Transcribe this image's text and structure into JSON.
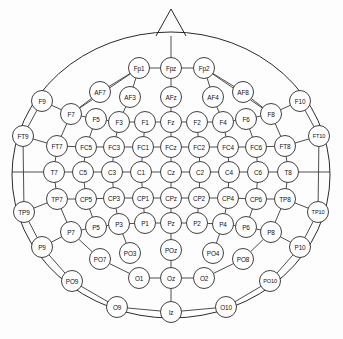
{
  "diagram": {
    "view": "top-down head map, nose at top",
    "colors": {
      "background": "#fdfdfd",
      "outline": "#2b2b2b",
      "link": "#3a3a3a",
      "node_fill": "#ffffff",
      "label": "#111111"
    },
    "head": {
      "center_x": 171,
      "center_y": 175,
      "radius_x": 159,
      "radius_y": 143
    },
    "nose": {
      "apex_x": 171,
      "apex_y": 9,
      "left_x": 156,
      "right_x": 186,
      "base_y": 36
    }
  },
  "electrodes": [
    {
      "label": "Fp1",
      "x": 139,
      "y": 68,
      "row": "Fp"
    },
    {
      "label": "Fpz",
      "x": 171,
      "y": 68,
      "row": "Fp"
    },
    {
      "label": "Fp2",
      "x": 204,
      "y": 68,
      "row": "Fp"
    },
    {
      "label": "AF7",
      "x": 100,
      "y": 92,
      "row": "AF"
    },
    {
      "label": "AF3",
      "x": 130,
      "y": 97,
      "row": "AF"
    },
    {
      "label": "AFz",
      "x": 171,
      "y": 97,
      "row": "AF"
    },
    {
      "label": "AF4",
      "x": 213,
      "y": 97,
      "row": "AF"
    },
    {
      "label": "AF8",
      "x": 243,
      "y": 92,
      "row": "AF"
    },
    {
      "label": "F9",
      "x": 42,
      "y": 101,
      "row": "F-outer"
    },
    {
      "label": "F10",
      "x": 300,
      "y": 101,
      "row": "F-outer"
    },
    {
      "label": "F7",
      "x": 71,
      "y": 114,
      "row": "F"
    },
    {
      "label": "F5",
      "x": 96,
      "y": 119,
      "row": "F"
    },
    {
      "label": "F3",
      "x": 119,
      "y": 122,
      "row": "F"
    },
    {
      "label": "F1",
      "x": 145,
      "y": 122,
      "row": "F"
    },
    {
      "label": "Fz",
      "x": 171,
      "y": 122,
      "row": "F"
    },
    {
      "label": "F2",
      "x": 197,
      "y": 122,
      "row": "F"
    },
    {
      "label": "F4",
      "x": 223,
      "y": 122,
      "row": "F"
    },
    {
      "label": "F6",
      "x": 246,
      "y": 119,
      "row": "F"
    },
    {
      "label": "F8",
      "x": 271,
      "y": 114,
      "row": "F"
    },
    {
      "label": "FT9",
      "x": 23,
      "y": 136,
      "row": "FT-outer"
    },
    {
      "label": "FT10",
      "x": 319,
      "y": 136,
      "row": "FT-outer"
    },
    {
      "label": "FT7",
      "x": 57,
      "y": 146,
      "row": "FC"
    },
    {
      "label": "FC5",
      "x": 86,
      "y": 147,
      "row": "FC"
    },
    {
      "label": "FC3",
      "x": 114,
      "y": 147,
      "row": "FC"
    },
    {
      "label": "FC1",
      "x": 143,
      "y": 147,
      "row": "FC"
    },
    {
      "label": "FCz",
      "x": 171,
      "y": 147,
      "row": "FC"
    },
    {
      "label": "FC2",
      "x": 199,
      "y": 147,
      "row": "FC"
    },
    {
      "label": "FC4",
      "x": 228,
      "y": 147,
      "row": "FC"
    },
    {
      "label": "FC6",
      "x": 256,
      "y": 147,
      "row": "FC"
    },
    {
      "label": "FT8",
      "x": 285,
      "y": 146,
      "row": "FC"
    },
    {
      "label": "T7",
      "x": 54,
      "y": 172,
      "row": "C"
    },
    {
      "label": "C5",
      "x": 83,
      "y": 172,
      "row": "C"
    },
    {
      "label": "C3",
      "x": 112,
      "y": 172,
      "row": "C"
    },
    {
      "label": "C1",
      "x": 141,
      "y": 172,
      "row": "C"
    },
    {
      "label": "Cz",
      "x": 171,
      "y": 172,
      "row": "C"
    },
    {
      "label": "C2",
      "x": 200,
      "y": 172,
      "row": "C"
    },
    {
      "label": "C4",
      "x": 229,
      "y": 172,
      "row": "C"
    },
    {
      "label": "C6",
      "x": 258,
      "y": 172,
      "row": "C"
    },
    {
      "label": "T8",
      "x": 288,
      "y": 172,
      "row": "C"
    },
    {
      "label": "TP9",
      "x": 24,
      "y": 212,
      "row": "TP-outer"
    },
    {
      "label": "TP10",
      "x": 318,
      "y": 212,
      "row": "TP-outer"
    },
    {
      "label": "TP7",
      "x": 57,
      "y": 199,
      "row": "CP"
    },
    {
      "label": "CP5",
      "x": 86,
      "y": 199,
      "row": "CP"
    },
    {
      "label": "CP3",
      "x": 114,
      "y": 198,
      "row": "CP"
    },
    {
      "label": "CP1",
      "x": 143,
      "y": 198,
      "row": "CP"
    },
    {
      "label": "CPz",
      "x": 171,
      "y": 198,
      "row": "CP"
    },
    {
      "label": "CP2",
      "x": 199,
      "y": 198,
      "row": "CP"
    },
    {
      "label": "CP4",
      "x": 228,
      "y": 198,
      "row": "CP"
    },
    {
      "label": "CP6",
      "x": 256,
      "y": 199,
      "row": "CP"
    },
    {
      "label": "TP8",
      "x": 285,
      "y": 199,
      "row": "CP"
    },
    {
      "label": "P9",
      "x": 42,
      "y": 247,
      "row": "P-outer"
    },
    {
      "label": "P10",
      "x": 300,
      "y": 247,
      "row": "P-outer"
    },
    {
      "label": "P7",
      "x": 71,
      "y": 232,
      "row": "P"
    },
    {
      "label": "P5",
      "x": 96,
      "y": 227,
      "row": "P"
    },
    {
      "label": "P3",
      "x": 119,
      "y": 224,
      "row": "P"
    },
    {
      "label": "P1",
      "x": 145,
      "y": 223,
      "row": "P"
    },
    {
      "label": "Pz",
      "x": 171,
      "y": 223,
      "row": "P"
    },
    {
      "label": "P2",
      "x": 197,
      "y": 223,
      "row": "P"
    },
    {
      "label": "P4",
      "x": 223,
      "y": 224,
      "row": "P"
    },
    {
      "label": "P6",
      "x": 246,
      "y": 227,
      "row": "P"
    },
    {
      "label": "P8",
      "x": 271,
      "y": 232,
      "row": "P"
    },
    {
      "label": "PO9",
      "x": 72,
      "y": 281,
      "row": "PO-outer"
    },
    {
      "label": "PO10",
      "x": 270,
      "y": 281,
      "row": "PO-outer"
    },
    {
      "label": "PO7",
      "x": 100,
      "y": 259,
      "row": "PO"
    },
    {
      "label": "PO3",
      "x": 130,
      "y": 253,
      "row": "PO"
    },
    {
      "label": "POz",
      "x": 171,
      "y": 250,
      "row": "PO"
    },
    {
      "label": "PO4",
      "x": 213,
      "y": 253,
      "row": "PO"
    },
    {
      "label": "PO8",
      "x": 243,
      "y": 259,
      "row": "PO"
    },
    {
      "label": "O1",
      "x": 139,
      "y": 278,
      "row": "O"
    },
    {
      "label": "Oz",
      "x": 171,
      "y": 278,
      "row": "O"
    },
    {
      "label": "O2",
      "x": 204,
      "y": 278,
      "row": "O"
    },
    {
      "label": "O9",
      "x": 117,
      "y": 307,
      "row": "O-outer"
    },
    {
      "label": "Iz",
      "x": 171,
      "y": 312,
      "row": "O-outer"
    },
    {
      "label": "O10",
      "x": 226,
      "y": 307,
      "row": "O-outer"
    }
  ],
  "connections": [
    [
      "Fp1",
      "Fpz"
    ],
    [
      "Fpz",
      "Fp2"
    ],
    [
      "Fpz",
      "nose"
    ],
    [
      "Fp1",
      "F7"
    ],
    [
      "Fp2",
      "F8"
    ],
    [
      "AF7",
      "F7"
    ],
    [
      "AF3",
      "F3"
    ],
    [
      "AFz",
      "Fz"
    ],
    [
      "AF4",
      "F4"
    ],
    [
      "AF8",
      "F8"
    ],
    [
      "AF7",
      "Fp1"
    ],
    [
      "AF8",
      "Fp2"
    ],
    [
      "AF3",
      "Fp1"
    ],
    [
      "AF4",
      "Fp2"
    ],
    [
      "AFz",
      "Fpz"
    ],
    [
      "F9",
      "F7"
    ],
    [
      "F10",
      "F8"
    ],
    [
      "F7",
      "F5"
    ],
    [
      "F5",
      "F3"
    ],
    [
      "F3",
      "F1"
    ],
    [
      "F1",
      "Fz"
    ],
    [
      "Fz",
      "F2"
    ],
    [
      "F2",
      "F4"
    ],
    [
      "F4",
      "F6"
    ],
    [
      "F6",
      "F8"
    ],
    [
      "F7",
      "FT7"
    ],
    [
      "F5",
      "FC5"
    ],
    [
      "F3",
      "FC3"
    ],
    [
      "F1",
      "FC1"
    ],
    [
      "Fz",
      "FCz"
    ],
    [
      "F2",
      "FC2"
    ],
    [
      "F4",
      "FC4"
    ],
    [
      "F6",
      "FC6"
    ],
    [
      "F8",
      "FT8"
    ],
    [
      "FT9",
      "FT7"
    ],
    [
      "FT10",
      "FT8"
    ],
    [
      "F9",
      "FT9"
    ],
    [
      "F10",
      "FT10"
    ],
    [
      "FT7",
      "FC5"
    ],
    [
      "FC5",
      "FC3"
    ],
    [
      "FC3",
      "FC1"
    ],
    [
      "FC1",
      "FCz"
    ],
    [
      "FCz",
      "FC2"
    ],
    [
      "FC2",
      "FC4"
    ],
    [
      "FC4",
      "FC6"
    ],
    [
      "FC6",
      "FT8"
    ],
    [
      "FT7",
      "T7"
    ],
    [
      "FC5",
      "C5"
    ],
    [
      "FC3",
      "C3"
    ],
    [
      "FC1",
      "C1"
    ],
    [
      "FCz",
      "Cz"
    ],
    [
      "FC2",
      "C2"
    ],
    [
      "FC4",
      "C4"
    ],
    [
      "FC6",
      "C6"
    ],
    [
      "FT8",
      "T8"
    ],
    [
      "T7",
      "C5"
    ],
    [
      "C5",
      "C3"
    ],
    [
      "C3",
      "C1"
    ],
    [
      "C1",
      "Cz"
    ],
    [
      "Cz",
      "C2"
    ],
    [
      "C2",
      "C4"
    ],
    [
      "C4",
      "C6"
    ],
    [
      "C6",
      "T8"
    ],
    [
      "T7",
      "TP7"
    ],
    [
      "C5",
      "CP5"
    ],
    [
      "C3",
      "CP3"
    ],
    [
      "C1",
      "CP1"
    ],
    [
      "Cz",
      "CPz"
    ],
    [
      "C2",
      "CP2"
    ],
    [
      "C4",
      "CP4"
    ],
    [
      "C6",
      "CP6"
    ],
    [
      "T8",
      "TP8"
    ],
    [
      "FT9",
      "TP9"
    ],
    [
      "FT10",
      "TP10"
    ],
    [
      "TP9",
      "TP7"
    ],
    [
      "TP10",
      "TP8"
    ],
    [
      "TP7",
      "CP5"
    ],
    [
      "CP5",
      "CP3"
    ],
    [
      "CP3",
      "CP1"
    ],
    [
      "CP1",
      "CPz"
    ],
    [
      "CPz",
      "CP2"
    ],
    [
      "CP2",
      "CP4"
    ],
    [
      "CP4",
      "CP6"
    ],
    [
      "CP6",
      "TP8"
    ],
    [
      "TP7",
      "P7"
    ],
    [
      "CP5",
      "P5"
    ],
    [
      "CP3",
      "P3"
    ],
    [
      "CP1",
      "P1"
    ],
    [
      "CPz",
      "Pz"
    ],
    [
      "CP2",
      "P2"
    ],
    [
      "CP4",
      "P4"
    ],
    [
      "CP6",
      "P6"
    ],
    [
      "TP8",
      "P8"
    ],
    [
      "TP9",
      "P9"
    ],
    [
      "TP10",
      "P10"
    ],
    [
      "P9",
      "P7"
    ],
    [
      "P10",
      "P8"
    ],
    [
      "P7",
      "P5"
    ],
    [
      "P5",
      "P3"
    ],
    [
      "P3",
      "P1"
    ],
    [
      "P1",
      "Pz"
    ],
    [
      "Pz",
      "P2"
    ],
    [
      "P2",
      "P4"
    ],
    [
      "P4",
      "P6"
    ],
    [
      "P6",
      "P8"
    ],
    [
      "P7",
      "PO7"
    ],
    [
      "P3",
      "PO3"
    ],
    [
      "Pz",
      "POz"
    ],
    [
      "P4",
      "PO4"
    ],
    [
      "P8",
      "PO8"
    ],
    [
      "P9",
      "PO9"
    ],
    [
      "P10",
      "PO10"
    ],
    [
      "PO7",
      "O1"
    ],
    [
      "PO8",
      "O2"
    ],
    [
      "POz",
      "Oz"
    ],
    [
      "O1",
      "Oz"
    ],
    [
      "Oz",
      "O2"
    ],
    [
      "PO9",
      "O9"
    ],
    [
      "PO10",
      "O10"
    ],
    [
      "O9",
      "Iz"
    ],
    [
      "Iz",
      "O10"
    ],
    [
      "Oz",
      "Iz"
    ],
    [
      "T7",
      "earLeft"
    ],
    [
      "T8",
      "earRight"
    ]
  ],
  "counts": {
    "electrode_count": 81
  }
}
